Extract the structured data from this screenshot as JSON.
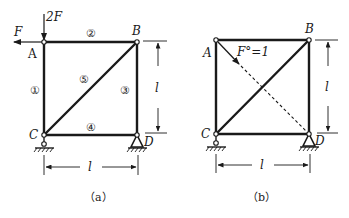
{
  "figure_a": {
    "caption": "（a）",
    "nodes": {
      "A": "A",
      "B": "B",
      "C": "C",
      "D": "D"
    },
    "loads": {
      "vertical": "2F",
      "horizontal": "F"
    },
    "members": [
      "①",
      "②",
      "③",
      "④",
      "⑤"
    ],
    "dimension_vertical": "l",
    "dimension_horizontal": "l"
  },
  "figure_b": {
    "caption": "（b）",
    "nodes": {
      "A": "A",
      "B": "B",
      "C": "C",
      "D": "D"
    },
    "unit_load_label": "F°=1",
    "dimension_vertical": "l",
    "dimension_horizontal": "l"
  },
  "colors": {
    "ink": "#1a1a1a",
    "background": "#ffffff"
  }
}
